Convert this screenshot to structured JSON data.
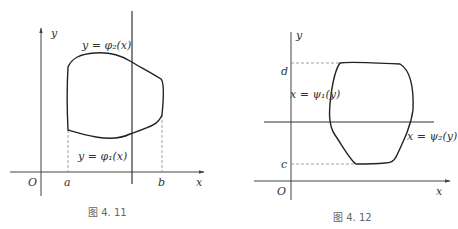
{
  "figures": [
    {
      "id": "fig-4-11",
      "caption": "图 4. 11",
      "labels": {
        "y_axis": "y",
        "x_axis": "x",
        "origin": "O",
        "a": "a",
        "b": "b",
        "upper_curve": "y = φ₂(x)",
        "lower_curve": "y = φ₁(x)"
      }
    },
    {
      "id": "fig-4-12",
      "caption": "图 4. 12",
      "labels": {
        "y_axis": "y",
        "x_axis": "x",
        "origin": "O",
        "c": "c",
        "d": "d",
        "left_curve": "x = ψ₁(y)",
        "right_curve": "x = ψ₂(y)"
      }
    }
  ]
}
